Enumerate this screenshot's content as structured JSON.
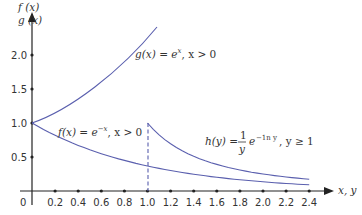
{
  "chart_data": {
    "type": "line",
    "title": "",
    "xlabel": "x, y",
    "ylabel_lines": [
      "f (x)",
      "g (x)"
    ],
    "xlim": [
      0,
      2.5
    ],
    "ylim": [
      0,
      2.3
    ],
    "x_ticks": [
      "0.2",
      "0.4",
      "0.6",
      "0.8",
      "1.0",
      "1.2",
      "1.4",
      "1.6",
      "1.8",
      "2.0",
      "2.2",
      "2.4"
    ],
    "x_tick_values": [
      0.2,
      0.4,
      0.6,
      0.8,
      1.0,
      1.2,
      1.4,
      1.6,
      1.8,
      2.0,
      2.2,
      2.4
    ],
    "y_ticks": [
      "0.5",
      "1.0",
      "1.5",
      "2.0"
    ],
    "y_tick_values": [
      0.5,
      1.0,
      1.5,
      2.0
    ],
    "origin_label": "0",
    "grid": false,
    "series": [
      {
        "name": "f(x) = e^-x, x > 0",
        "x": [
          0,
          0.4,
          0.8,
          1.2,
          1.6,
          2.0,
          2.4
        ],
        "values": [
          1.0,
          0.67,
          0.45,
          0.3,
          0.2,
          0.135,
          0.09
        ]
      },
      {
        "name": "g(x) = e^x, x > 0",
        "x": [
          0,
          0.2,
          0.4,
          0.6,
          0.8,
          1.0,
          1.1
        ],
        "values": [
          1.0,
          1.22,
          1.49,
          1.82,
          2.23,
          2.4,
          2.4
        ]
      },
      {
        "name": "h(y) = (1/y) e^(-ln y), y >= 1",
        "x": [
          1.0,
          1.2,
          1.4,
          1.6,
          1.8,
          2.0,
          2.2,
          2.4
        ],
        "values": [
          1.0,
          0.69,
          0.51,
          0.39,
          0.31,
          0.25,
          0.21,
          0.17
        ]
      }
    ],
    "annotations": [
      {
        "text": "g(x) = e^x, x > 0"
      },
      {
        "text": "f(x) = e^-x, x > 0"
      },
      {
        "text": "h(y) = 1/y e^-ln y, y ≥ 1"
      },
      {
        "text": "dashed vertical line at x = 1.0"
      }
    ]
  },
  "labels": {
    "y1": "f (x)",
    "y2": "g (x)",
    "x": "x, y",
    "origin": "0",
    "g_pre": "g(x) = e",
    "g_sup": "x",
    "g_post": ", x > 0",
    "f_pre": "f(x) = e",
    "f_sup": "−x",
    "f_post": ", x > 0",
    "h_pre": "h(y) =",
    "h_num": "1",
    "h_den": "y",
    "h_e": "e",
    "h_sup": "−1n y",
    "h_post": ", y ≥ 1"
  },
  "colors": {
    "curve": "#5a5fae",
    "axis": "#222222"
  }
}
